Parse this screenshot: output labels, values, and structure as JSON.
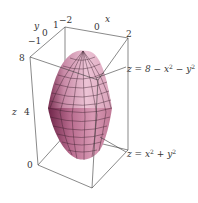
{
  "figure": {
    "type": "3d-surface-region",
    "surfaces": [
      {
        "name": "upper",
        "equation": "z = 8 − x² − y²",
        "eq_parts": [
          "z = 8 − x",
          "2",
          " − y",
          "2"
        ]
      },
      {
        "name": "lower",
        "equation": "z = x² + y²",
        "eq_parts": [
          "z = x",
          "2",
          " + y",
          "2"
        ]
      }
    ],
    "colors": {
      "surface_light": "#e9bcd0",
      "surface_mid": "#c98aa7",
      "surface_dark": "#7a2f52",
      "mesh": "#3a1f2c",
      "box": "#3a3a3a",
      "text": "#333333"
    }
  },
  "axes": {
    "x": {
      "label": "x",
      "ticks": [
        "−2",
        "0",
        "2"
      ]
    },
    "y": {
      "label": "y",
      "ticks": [
        "−1",
        "0",
        "1"
      ]
    },
    "z": {
      "label": "z",
      "ticks": [
        "0",
        "4",
        "8"
      ]
    }
  }
}
